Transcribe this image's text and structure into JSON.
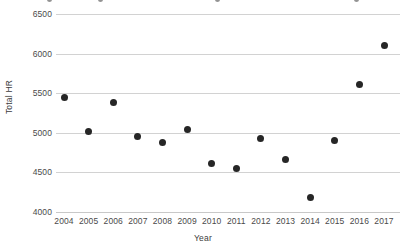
{
  "chart_data": {
    "type": "scatter",
    "title": "",
    "xlabel": "Year",
    "ylabel": "Total HR",
    "x": [
      2004,
      2005,
      2006,
      2007,
      2008,
      2009,
      2010,
      2011,
      2012,
      2013,
      2014,
      2015,
      2016,
      2017
    ],
    "values": [
      5451,
      5017,
      5386,
      4957,
      4878,
      5042,
      4613,
      4552,
      4934,
      4661,
      4186,
      4909,
      5610,
      6105
    ],
    "categories": [
      "2004",
      "2005",
      "2006",
      "2007",
      "2008",
      "2009",
      "2010",
      "2011",
      "2012",
      "2013",
      "2014",
      "2015",
      "2016",
      "2017"
    ],
    "xlim": [
      2003.5,
      2017.5
    ],
    "ylim": [
      4000,
      6500
    ],
    "yticks": [
      4000,
      4500,
      5000,
      5500,
      6000,
      6500
    ],
    "ytick_labels": [
      "4000",
      "4500",
      "5000",
      "5500",
      "6000",
      "6500"
    ],
    "xtick_labels": [
      "2004",
      "2005",
      "2006",
      "2007",
      "2008",
      "2009",
      "2010",
      "2011",
      "2012",
      "2013",
      "2014",
      "2015",
      "2016",
      "2017"
    ],
    "grid": "horizontal",
    "legend": "none",
    "marker_color": "#262626",
    "gridline_color": "#d2d2d2",
    "background": "#ffffff",
    "series": [
      {
        "name": "Total HR",
        "values": [
          5451,
          5017,
          5386,
          4957,
          4878,
          5042,
          4613,
          4552,
          4934,
          4661,
          4186,
          4909,
          5610,
          6105
        ]
      }
    ]
  }
}
